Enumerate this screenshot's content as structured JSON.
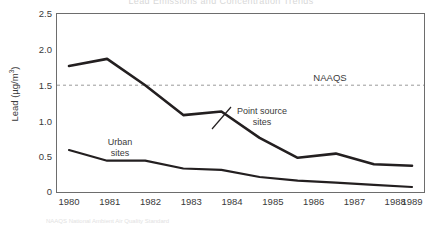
{
  "figure": {
    "partial_title": "Lead Emissions and Concentration Trends",
    "caption": "NAAQS National Ambient Air Quality Standard"
  },
  "axes": {
    "y_label": "Lead (µg/m",
    "y_label_sup": "3",
    "y_label_close": ")",
    "y_ticks": [
      "2.5",
      "2.0",
      "1.5",
      "1.0",
      "0.5",
      "0"
    ],
    "x_ticks": [
      "1980",
      "1981",
      "1982",
      "1983",
      "1984",
      "1985",
      "1986",
      "1987",
      "1988",
      "1989"
    ]
  },
  "annotations": {
    "naaqs": "NAAQS",
    "point_source_line1": "Point source",
    "point_source_line2": "sites",
    "urban_line1": "Urban",
    "urban_line2": "sites"
  },
  "colors": {
    "line": "#231f20",
    "frame": "#6d6d6d",
    "threshold": "#9a9a9a",
    "background": "#ffffff"
  },
  "chart_data": {
    "type": "line",
    "title": "",
    "xlabel": "",
    "ylabel": "Lead (µg/m3)",
    "x": [
      1980,
      1981,
      1982,
      1983,
      1984,
      1985,
      1986,
      1987,
      1988,
      1989
    ],
    "categories": [
      "1980",
      "1981",
      "1982",
      "1983",
      "1984",
      "1985",
      "1986",
      "1987",
      "1988",
      "1989"
    ],
    "ylim": [
      0,
      2.5
    ],
    "yticks": [
      0,
      0.5,
      1.0,
      1.5,
      2.0,
      2.5
    ],
    "grid": false,
    "legend_position": "inline-annotations",
    "series": [
      {
        "name": "Point source sites",
        "values": [
          1.77,
          1.87,
          1.5,
          1.08,
          1.13,
          0.76,
          0.48,
          0.54,
          0.39,
          0.37
        ]
      },
      {
        "name": "Urban sites",
        "values": [
          0.59,
          0.44,
          0.44,
          0.33,
          0.31,
          0.21,
          0.16,
          0.13,
          0.1,
          0.07
        ]
      }
    ],
    "threshold_lines": [
      {
        "label": "NAAQS",
        "value": 1.5,
        "style": "dashed"
      }
    ]
  }
}
